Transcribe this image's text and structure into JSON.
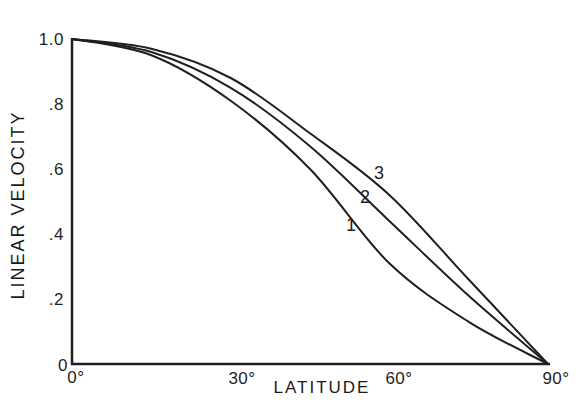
{
  "chart_data": {
    "type": "line",
    "title": "",
    "xlabel": "LATITUDE",
    "ylabel": "LINEAR VELOCITY",
    "xlim": [
      0,
      90
    ],
    "ylim": [
      0,
      1.0
    ],
    "grid": false,
    "legend": "inline curve labels",
    "x_ticks": [
      "0°",
      "30°",
      "60°",
      "90°"
    ],
    "y_ticks": [
      "0",
      ".2",
      ".4",
      ".6",
      ".8",
      "1.0"
    ],
    "x": [
      0,
      15,
      30,
      45,
      60,
      75,
      90
    ],
    "series": [
      {
        "name": "1",
        "values": [
          1.0,
          0.95,
          0.81,
          0.6,
          0.31,
          0.13,
          0.0
        ]
      },
      {
        "name": "2",
        "values": [
          1.0,
          0.96,
          0.85,
          0.67,
          0.44,
          0.21,
          0.0
        ]
      },
      {
        "name": "3",
        "values": [
          1.0,
          0.97,
          0.88,
          0.71,
          0.52,
          0.26,
          0.0
        ]
      }
    ],
    "annotations": [
      {
        "text": "1",
        "x": 52,
        "y": 0.42
      },
      {
        "text": "2",
        "x": 55,
        "y": 0.51
      },
      {
        "text": "3",
        "x": 58,
        "y": 0.58
      }
    ]
  },
  "axes": {
    "xlabel": "LATITUDE",
    "ylabel": "LINEAR VELOCITY",
    "x_ticks": [
      "0°",
      "30°",
      "60°",
      "90°"
    ],
    "y_ticks": [
      "0",
      ".2",
      ".4",
      ".6",
      ".8",
      "1.0"
    ]
  },
  "curve_labels": [
    "1",
    "2",
    "3"
  ],
  "colors": {
    "line": "#1f1f1f",
    "background": "#ffffff"
  }
}
